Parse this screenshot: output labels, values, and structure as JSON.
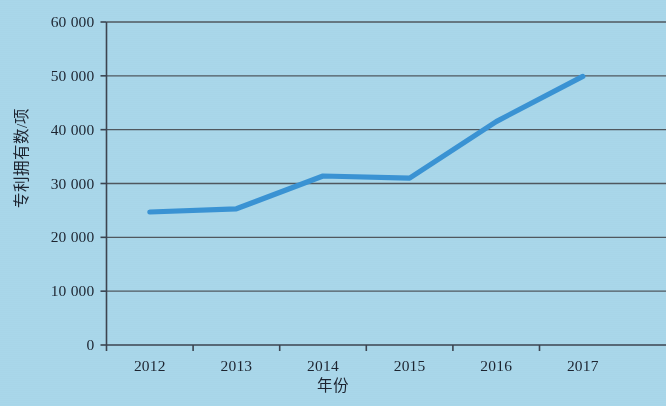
{
  "chart_data": {
    "type": "line",
    "title": "",
    "xlabel": "年份",
    "ylabel": "专利拥有数/项",
    "categories": [
      "2012",
      "2013",
      "2014",
      "2015",
      "2016",
      "2017"
    ],
    "x": [
      2012,
      2013,
      2014,
      2015,
      2016,
      2017
    ],
    "values": [
      24700,
      25300,
      31400,
      31000,
      41500,
      49900
    ],
    "series": [
      {
        "name": "专利拥有数",
        "values": [
          24700,
          25300,
          31400,
          31000,
          41500,
          49900
        ]
      }
    ],
    "ylim": [
      0,
      60000
    ],
    "ytick_labels": [
      "0",
      "10 000",
      "20 000",
      "30 000",
      "40 000",
      "50 000",
      "60 000"
    ],
    "ytick_values": [
      0,
      10000,
      20000,
      30000,
      40000,
      50000,
      60000
    ],
    "xtick_labels": [
      "2012",
      "2013",
      "2014",
      "2015",
      "2016",
      "2017"
    ],
    "grid": "horizontal",
    "legend": "none",
    "line_color": "#3a93d4",
    "axis_color": "#3c4450",
    "grid_color": "#50585f",
    "background_color": "#a9d7ea",
    "text_color": "#1d2430",
    "markers": false
  }
}
